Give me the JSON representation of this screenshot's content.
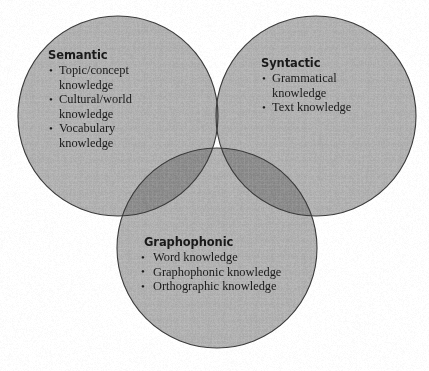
{
  "figure": {
    "kind": "venn-diagram-three-circle",
    "background_color": "#ffffff",
    "circle_fill_color": "#b0b0b0",
    "overlap_fill_color": "#8a8a8a",
    "center_overlap_fill_color": "#878787",
    "outline_color": "#3b3b3b",
    "text_color": "#1a1a1a"
  },
  "groups": {
    "semantic": {
      "title": "Semantic",
      "items": [
        "Topic/concept\nknowledge",
        "Cultural/world\nknowledge",
        "Vocabulary\nknowledge"
      ]
    },
    "syntactic": {
      "title": "Syntactic",
      "items": [
        "Grammatical\nknowledge",
        "Text knowledge"
      ]
    },
    "graphophonic": {
      "title": "Graphophonic",
      "items": [
        "Word knowledge",
        "Graphophonic knowledge",
        "Orthographic knowledge"
      ]
    }
  }
}
